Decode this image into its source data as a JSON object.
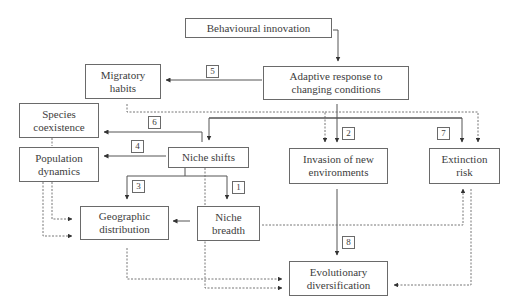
{
  "diagram": {
    "nodes": {
      "behavioural_innovation": "Behavioural innovation",
      "adaptive_response": "Adaptive response to changing conditions",
      "migratory_habits": "Migratory habits",
      "species_coexistence": "Species coexistence",
      "population_dynamics": "Population dynamics",
      "niche_shifts": "Niche shifts",
      "invasion": "Invasion of new environments",
      "extinction_risk": "Extinction risk",
      "geographic_distribution": "Geographic distribution",
      "niche_breadth": "Niche breadth",
      "evolutionary_diversification": "Evolutionary diversification"
    },
    "labels": {
      "n1": "1",
      "n2": "2",
      "n3": "3",
      "n4": "4",
      "n5": "5",
      "n6": "6",
      "n7": "7",
      "n8": "8"
    },
    "edges": [
      {
        "from": "Behavioural innovation",
        "to": "Adaptive response to changing conditions",
        "style": "solid"
      },
      {
        "from": "Adaptive response to changing conditions",
        "to": "Migratory habits",
        "style": "solid",
        "label": "5"
      },
      {
        "from": "Adaptive response to changing conditions",
        "to": "Invasion of new environments",
        "style": "solid",
        "label": "2"
      },
      {
        "from": "Adaptive response to changing conditions",
        "to": "Niche shifts",
        "style": "solid"
      },
      {
        "from": "Adaptive response to changing conditions",
        "to": "Extinction risk",
        "style": "solid",
        "label": "7"
      },
      {
        "from": "Niche shifts",
        "to": "Species coexistence",
        "style": "solid",
        "label": "6"
      },
      {
        "from": "Niche shifts",
        "to": "Population dynamics",
        "style": "solid",
        "label": "4"
      },
      {
        "from": "Niche shifts",
        "to": "Geographic distribution",
        "style": "solid",
        "label": "3"
      },
      {
        "from": "Niche shifts",
        "to": "Niche breadth",
        "style": "solid",
        "label": "1"
      },
      {
        "from": "Niche breadth",
        "to": "Geographic distribution",
        "style": "solid"
      },
      {
        "from": "Invasion of new environments",
        "to": "Evolutionary diversification",
        "style": "solid",
        "label": "8"
      },
      {
        "from": "Migratory habits",
        "to": "Invasion of new environments",
        "style": "dashed"
      },
      {
        "from": "Migratory habits",
        "to": "Extinction risk",
        "style": "dashed"
      },
      {
        "from": "Species coexistence",
        "to": "Population dynamics",
        "style": "dashed"
      },
      {
        "from": "Population dynamics",
        "to": "Geographic distribution",
        "style": "dashed"
      },
      {
        "from": "Niche breadth",
        "to": "Extinction risk",
        "style": "dashed"
      },
      {
        "from": "Geographic distribution",
        "to": "Evolutionary diversification",
        "style": "dashed"
      },
      {
        "from": "Niche shifts",
        "to": "Evolutionary diversification",
        "style": "dashed"
      },
      {
        "from": "Extinction risk",
        "to": "Evolutionary diversification",
        "style": "dashed"
      }
    ]
  }
}
